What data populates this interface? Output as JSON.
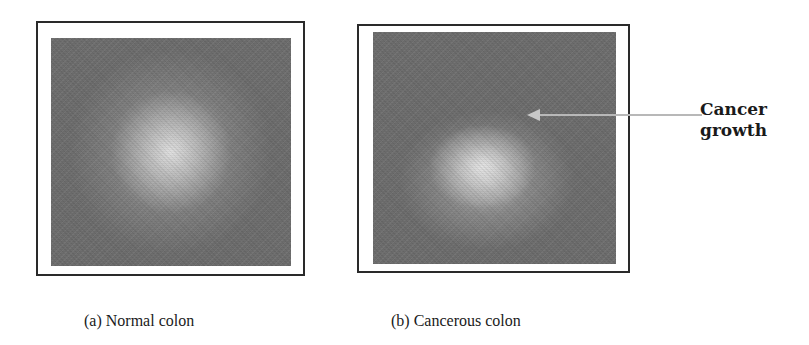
{
  "figure": {
    "panels": [
      {
        "id": "a",
        "caption": "(a) Normal colon",
        "image_description": "grayscale image with diffuse bright center"
      },
      {
        "id": "b",
        "caption": "(b) Cancerous colon",
        "image_description": "grayscale image with bright irregular mass in lower center"
      }
    ],
    "annotation": {
      "line1": "Cancer",
      "line2": "growth",
      "arrow_color": "#b8b8b8"
    },
    "colors": {
      "border": "#2a2a2a",
      "image_base": "#6e6e6e",
      "text": "#1a1a1a",
      "background": "#ffffff"
    }
  }
}
